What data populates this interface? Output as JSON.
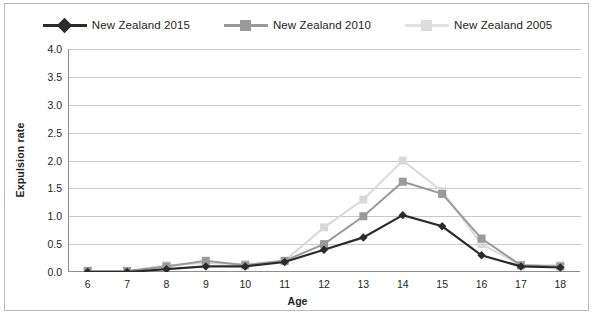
{
  "chart_data": {
    "type": "line",
    "title": "",
    "xlabel": "Age",
    "ylabel": "Expulsion rate",
    "categories": [
      6,
      7,
      8,
      9,
      10,
      11,
      12,
      13,
      14,
      15,
      16,
      17,
      18
    ],
    "x_tick_labels": [
      "6",
      "7",
      "8",
      "9",
      "10",
      "11",
      "12",
      "13",
      "14",
      "15",
      "16",
      "17",
      "18"
    ],
    "y_tick_labels": [
      "0.0",
      "0.5",
      "1.0",
      "1.5",
      "2.0",
      "2.5",
      "3.0",
      "3.5",
      "4.0"
    ],
    "y_ticks": [
      0.0,
      0.5,
      1.0,
      1.5,
      2.0,
      2.5,
      3.0,
      3.5,
      4.0
    ],
    "ylim": [
      0.0,
      4.0
    ],
    "grid": "horizontal",
    "legend_position": "top",
    "series": [
      {
        "name": "New Zealand 2015",
        "color": "#2b2b2b",
        "marker": "diamond",
        "values": [
          0.0,
          0.0,
          0.05,
          0.1,
          0.1,
          0.18,
          0.4,
          0.62,
          1.02,
          0.82,
          0.3,
          0.1,
          0.08
        ]
      },
      {
        "name": "New Zealand 2010",
        "color": "#9a9a9a",
        "marker": "square",
        "values": [
          0.02,
          0.02,
          0.1,
          0.2,
          0.12,
          0.2,
          0.5,
          1.0,
          1.62,
          1.4,
          0.6,
          0.12,
          0.1
        ]
      },
      {
        "name": "New Zealand 2005",
        "color": "#d9d9d9",
        "marker": "square",
        "values": [
          0.02,
          0.02,
          0.12,
          0.16,
          0.14,
          0.2,
          0.8,
          1.3,
          2.0,
          1.45,
          0.5,
          0.12,
          0.12
        ]
      }
    ]
  },
  "axis": {
    "ylabel": "Expulsion rate",
    "xlabel": "Age"
  }
}
